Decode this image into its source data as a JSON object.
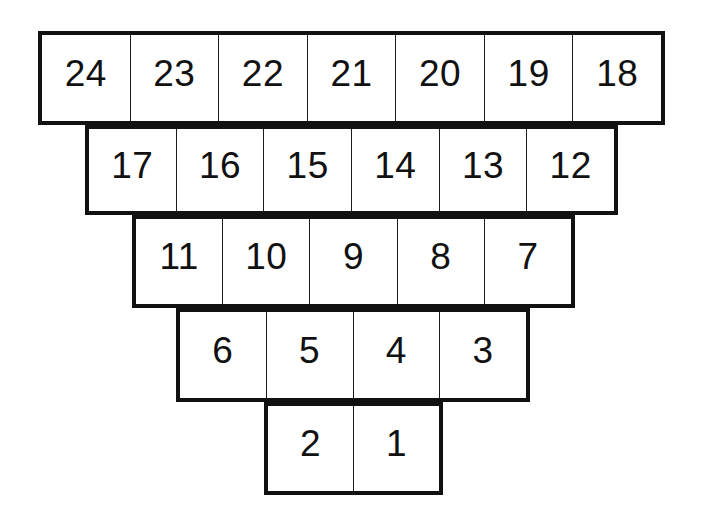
{
  "figure": {
    "kind": "numbered-pyramid-grid",
    "total_cells": 24,
    "background_color": "#ffffff",
    "line_color": "#111111",
    "text_color": "#111111",
    "outer_border_width_px": 4,
    "inner_divider_width_px": 1.6
  },
  "rows": [
    {
      "row_index": 1,
      "name": "row-top",
      "cell_count": 7,
      "cells": [
        "24",
        "23",
        "22",
        "21",
        "20",
        "19",
        "18"
      ]
    },
    {
      "row_index": 2,
      "name": "row-second",
      "cell_count": 6,
      "cells": [
        "17",
        "16",
        "15",
        "14",
        "13",
        "12"
      ]
    },
    {
      "row_index": 3,
      "name": "row-third",
      "cell_count": 5,
      "cells": [
        "11",
        "10",
        "9",
        "8",
        "7"
      ]
    },
    {
      "row_index": 4,
      "name": "row-fourth",
      "cell_count": 4,
      "cells": [
        "6",
        "5",
        "4",
        "3"
      ]
    },
    {
      "row_index": 5,
      "name": "row-bottom",
      "cell_count": 2,
      "cells": [
        "2",
        "1"
      ]
    }
  ],
  "chart_data": {
    "type": "table",
    "title": "",
    "xlabel": "",
    "ylabel": "",
    "rows": [
      [
        "24",
        "23",
        "22",
        "21",
        "20",
        "19",
        "18"
      ],
      [
        "17",
        "16",
        "15",
        "14",
        "13",
        "12"
      ],
      [
        "11",
        "10",
        "9",
        "8",
        "7"
      ],
      [
        "6",
        "5",
        "4",
        "3"
      ],
      [
        "2",
        "1"
      ]
    ],
    "row_lengths": [
      7,
      6,
      5,
      4,
      2
    ],
    "value_range": [
      1,
      24
    ],
    "ordering": "descending left-to-right, top-to-bottom"
  }
}
